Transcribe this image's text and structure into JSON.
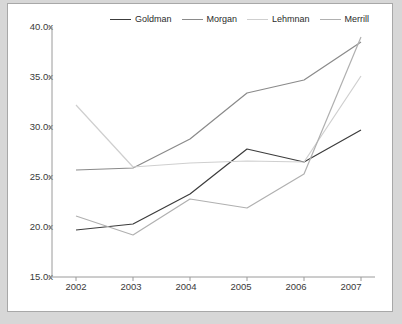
{
  "chart_data": {
    "type": "line",
    "title": "",
    "xlabel": "",
    "ylabel": "",
    "categories": [
      "2002",
      "2003",
      "2004",
      "2005",
      "2006",
      "2007"
    ],
    "ylim": [
      15.0,
      40.0
    ],
    "ytick_labels": [
      "40.0x",
      "35.0x",
      "30.0x",
      "25.0x",
      "20.0x",
      "15.0x"
    ],
    "ytick_values": [
      40.0,
      35.0,
      30.0,
      25.0,
      20.0,
      15.0
    ],
    "grid": false,
    "legend_position": "top",
    "series": [
      {
        "name": "Goldman",
        "color": "#3c3c3c",
        "values": [
          19.7,
          20.3,
          23.3,
          27.8,
          26.5,
          29.7
        ]
      },
      {
        "name": "Morgan",
        "color": "#8a8a8a",
        "values": [
          25.7,
          25.9,
          28.8,
          33.4,
          34.7,
          38.5
        ]
      },
      {
        "name": "Lehmnan",
        "color": "#cfcfcf",
        "values": [
          32.2,
          26.0,
          26.4,
          26.6,
          26.5,
          35.1
        ]
      },
      {
        "name": "Merrill",
        "color": "#b0b0b0",
        "values": [
          21.1,
          19.2,
          22.8,
          21.9,
          25.3,
          39.0
        ]
      }
    ]
  },
  "axis": {
    "line_color": "#9a9a9a"
  }
}
